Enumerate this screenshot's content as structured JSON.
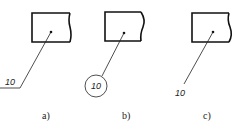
{
  "diagram": {
    "type": "leader-line-callout-variants",
    "panels": [
      {
        "id": "a",
        "caption": "a)",
        "callout": "10",
        "style": "text on horizontal shelf",
        "rect": {
          "x": 32,
          "y": 13,
          "w": 38,
          "h": 29
        },
        "dot": {
          "x": 51,
          "y": 32
        },
        "leader_end": {
          "x": 20,
          "y": 88
        },
        "shelf_end": {
          "x": 0,
          "y": 88
        },
        "text_pos": {
          "x": 5,
          "y": 85
        },
        "caption_pos": {
          "x": 42,
          "y": 119
        }
      },
      {
        "id": "b",
        "caption": "b)",
        "callout": "10",
        "style": "text in circle",
        "rect": {
          "x": 105,
          "y": 12,
          "w": 36,
          "h": 29
        },
        "dot": {
          "x": 124,
          "y": 33
        },
        "circle": {
          "cx": 96,
          "cy": 86,
          "r": 11
        },
        "caption_pos": {
          "x": 122,
          "y": 119
        }
      },
      {
        "id": "c",
        "caption": "c)",
        "callout": "10",
        "style": "text at end of leader",
        "rect": {
          "x": 192,
          "y": 13,
          "w": 37,
          "h": 29
        },
        "dot": {
          "x": 213,
          "y": 32
        },
        "leader_end": {
          "x": 184,
          "y": 84
        },
        "text_pos": {
          "x": 175,
          "y": 96
        },
        "caption_pos": {
          "x": 203,
          "y": 119
        }
      }
    ]
  }
}
